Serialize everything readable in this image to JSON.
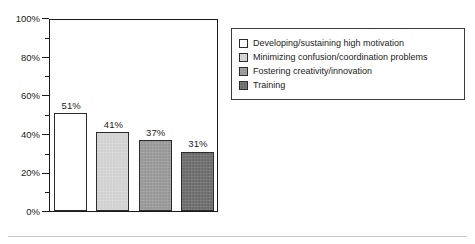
{
  "chart_data": {
    "type": "bar",
    "title": "",
    "subtitle": "",
    "xlabel": "",
    "ylabel": "",
    "ylim": [
      0,
      100
    ],
    "grid": false,
    "legend_position": "right",
    "value_suffix": "%",
    "categories": [
      "Developing/sustaining high motivation",
      "Minimizing confusion/coordination problems",
      "Fostering creativity/innovation",
      "Training"
    ],
    "values": [
      51,
      41,
      37,
      31
    ],
    "data_labels": [
      "51%",
      "41%",
      "37%",
      "31%"
    ],
    "bar_colors": [
      "#ffffff",
      "#d4d4d4",
      "#989898",
      "#6b6b6b"
    ],
    "bar_border_color": "#2b2b2b",
    "y_ticks_major": [
      0,
      20,
      40,
      60,
      80,
      100
    ],
    "y_tick_labels": [
      "0%",
      "20%",
      "40%",
      "60%",
      "80%",
      "100%"
    ],
    "y_ticks_minor": [
      10,
      30,
      50,
      70,
      90
    ],
    "axis_color": "#1a1a1a"
  },
  "legend": {
    "items": [
      {
        "label": "Developing/sustaining high motivation",
        "color": "#ffffff"
      },
      {
        "label": "Minimizing confusion/coordination problems",
        "color": "#d4d4d4"
      },
      {
        "label": "Fostering creativity/innovation",
        "color": "#989898"
      },
      {
        "label": "Training",
        "color": "#6b6b6b"
      }
    ]
  }
}
